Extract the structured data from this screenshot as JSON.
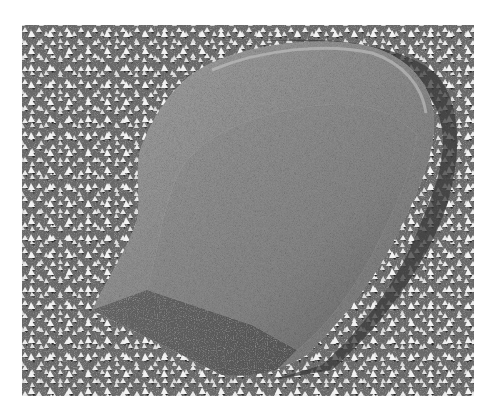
{
  "image": {
    "kind": "grayscale freeze-fracture electron micrograph",
    "subject": "large smooth particle on a field of small bright pyramidal particles",
    "frame": {
      "x": 22,
      "y": 25,
      "width": 452,
      "height": 371
    },
    "colors": {
      "page_background": "#ffffff",
      "field_background": "#6e6e6e",
      "field_particles": "#e8e8e8",
      "particle_shadow": "#3a3a3a",
      "particle_rim": "#9a9a9a",
      "particle_textured_face": "#888888",
      "smooth_lower_facet": "#5c5c5c"
    }
  }
}
